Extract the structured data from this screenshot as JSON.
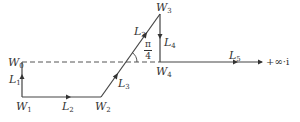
{
  "diagram": {
    "type": "complex-plane contour",
    "points": {
      "W0": {
        "name": "W",
        "sub": "0"
      },
      "W1": {
        "name": "W",
        "sub": "1"
      },
      "W2": {
        "name": "W",
        "sub": "2"
      },
      "W3": {
        "name": "W",
        "sub": "3"
      },
      "W4": {
        "name": "W",
        "sub": "4"
      }
    },
    "segments": {
      "L1": {
        "name": "L",
        "sub": "1"
      },
      "L2": {
        "name": "L",
        "sub": "2"
      },
      "L3a": {
        "name": "L",
        "sub": "3"
      },
      "L3b": {
        "name": "L",
        "sub": "3"
      },
      "L4": {
        "name": "L",
        "sub": "4"
      },
      "L5": {
        "name": "L",
        "sub": "5"
      }
    },
    "angle": {
      "numerator": "π",
      "denominator": "4"
    },
    "endpoint_label": "+∞·i",
    "line_color": "#444444"
  }
}
